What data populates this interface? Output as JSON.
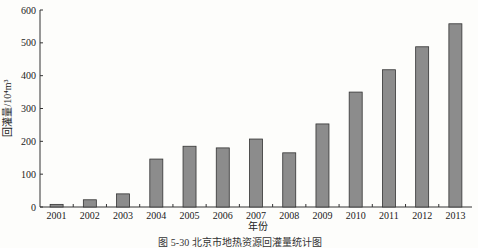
{
  "chart_data": {
    "type": "bar",
    "title": "",
    "caption": "图 5-30 北京市地热资源回灌量统计图",
    "xlabel": "年份",
    "ylabel": "回灌量/10⁴m³",
    "ylim": [
      0,
      600
    ],
    "yticks": [
      0,
      100,
      200,
      300,
      400,
      500,
      600
    ],
    "grid": false,
    "legend": "none",
    "categories": [
      "2001",
      "2002",
      "2003",
      "2004",
      "2005",
      "2006",
      "2007",
      "2008",
      "2009",
      "2010",
      "2011",
      "2012",
      "2013"
    ],
    "values": [
      8,
      22,
      40,
      146,
      185,
      180,
      207,
      165,
      253,
      350,
      418,
      488,
      558
    ],
    "colors": {
      "bar_fill": "#8c8c8c",
      "bar_stroke": "#333333",
      "axis": "#333333"
    }
  }
}
